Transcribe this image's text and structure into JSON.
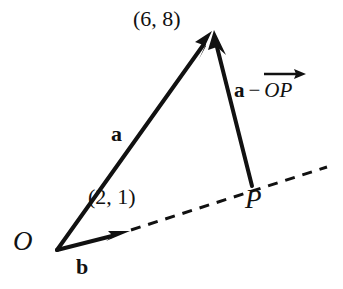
{
  "figure": {
    "type": "vector-diagram",
    "background_color": "#ffffff",
    "stroke_color": "#111111",
    "points": {
      "origin": {
        "label": "O",
        "x": 57,
        "y": 250
      },
      "apex": {
        "label": "(6, 8)",
        "x": 212,
        "y": 31
      },
      "foot": {
        "label": "P",
        "x": 252,
        "y": 186
      },
      "b_tip": {
        "label": "(2, 1)",
        "x": 126,
        "y": 232
      },
      "dash_end": {
        "x": 327,
        "y": 167
      }
    },
    "labels": {
      "origin": "O",
      "foot": "P",
      "vector_a": "a",
      "vector_b": "b",
      "apex_coords": "(6, 8)",
      "b_coords": "(2, 1)",
      "difference_bold": "a",
      "difference_operator": "−",
      "difference_vector": "OP"
    },
    "segments": [
      {
        "name": "vector-a",
        "from": "origin",
        "to": "apex",
        "style": "solid",
        "arrowhead": true
      },
      {
        "name": "vector-a-minus-OP",
        "from": "foot",
        "to": "apex",
        "style": "solid",
        "arrowhead": true
      },
      {
        "name": "vector-b",
        "from": "origin",
        "to": "b_tip",
        "style": "solid",
        "arrowhead": true
      },
      {
        "name": "line-of-b-extended",
        "from": "b_tip",
        "to": "dash_end",
        "style": "dashed",
        "arrowhead": false
      }
    ]
  }
}
